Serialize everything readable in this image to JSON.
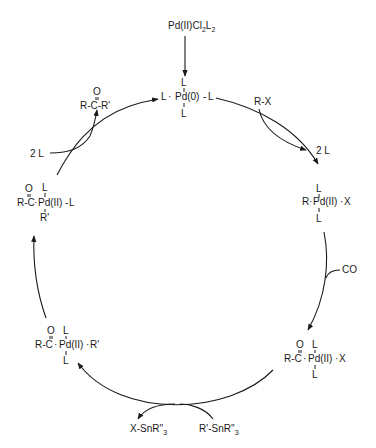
{
  "diagram": {
    "type": "catalytic-cycle",
    "precatalyst": {
      "label": "Pd(II)Cl",
      "sub1": "2",
      "mid": "L",
      "sub2": "2"
    },
    "species": {
      "pd0": {
        "left": "L",
        "metal": "Pd(0)",
        "right": "L",
        "top": "L",
        "bottom": "L"
      },
      "oxidative_addition": {
        "left": "R",
        "metal": "Pd(II)",
        "right": "X",
        "top": "L",
        "bottom": "L"
      },
      "acyl_x": {
        "acyl": "R-C",
        "oxygen": "O",
        "metal": "Pd(II)",
        "right": "X",
        "top": "L",
        "bottom": "L"
      },
      "acyl_r": {
        "acyl": "R-C",
        "oxygen": "O",
        "metal": "Pd(II)",
        "right": "R'",
        "top": "L",
        "bottom": "L"
      },
      "acyl_r_iso": {
        "acyl": "R-C",
        "oxygen": "O",
        "metal": "Pd(II)",
        "right": "L",
        "top": "L",
        "bottom": "R'"
      }
    },
    "reagents": {
      "rx": "R-X",
      "co": "CO",
      "stannane_in": {
        "main": "R'-SnR''",
        "sub": "3"
      },
      "stannane_out": {
        "main": "X-SnR''",
        "sub": "3"
      },
      "ligand_out": "2 L",
      "ligand_in": "2 L"
    },
    "product": {
      "oxygen": "O",
      "formula": "R-C-R'"
    }
  }
}
